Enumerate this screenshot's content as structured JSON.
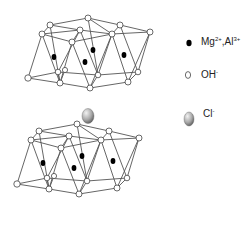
{
  "diagram": {
    "layers": [
      "top-hydroxide-layer",
      "bottom-hydroxide-layer"
    ],
    "interlayer_anion": "Cl-"
  },
  "legend": {
    "items": [
      {
        "icon": "black-filled-circle",
        "label": "Mg",
        "sup1": "2+",
        "sep": ",Al",
        "sup2": "3+"
      },
      {
        "icon": "white-open-circle",
        "label": "OH",
        "sup1": "-"
      },
      {
        "icon": "gray-sphere",
        "label": "Cl",
        "sup1": "-"
      }
    ]
  },
  "colors": {
    "line": "#555555",
    "metal": "#000000",
    "hydroxide_fill": "#ffffff",
    "chloride_light": "#e8e8e8",
    "chloride_dark": "#6a6a6a"
  }
}
